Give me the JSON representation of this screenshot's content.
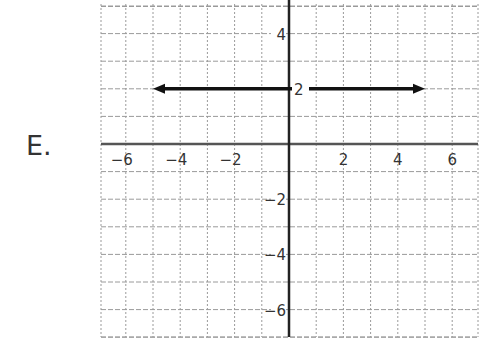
{
  "problem_label": "E.",
  "chart_data": {
    "type": "line",
    "title": "",
    "xlabel": "",
    "ylabel": "",
    "xlim": [
      -7,
      7
    ],
    "ylim": [
      -7,
      5
    ],
    "grid": true,
    "x_tick_labels": [
      "−6",
      "−4",
      "−2",
      "2",
      "4",
      "6"
    ],
    "y_tick_labels": [
      "4",
      "2",
      "−2",
      "−4",
      "−6"
    ],
    "series": [
      {
        "name": "y = 2",
        "x": [
          -5,
          5
        ],
        "y": [
          2,
          2
        ],
        "arrows": "both"
      }
    ],
    "colors": {
      "axis": "#222222",
      "grid": "#9a9a9a",
      "line": "#111111"
    }
  }
}
